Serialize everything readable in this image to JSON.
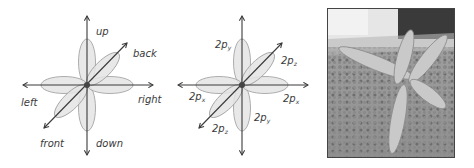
{
  "figures": [
    {
      "id": "direction-diagram",
      "labels": {
        "up": "up",
        "back": "back",
        "left": "left",
        "right": "right",
        "front": "front",
        "down": "down"
      }
    },
    {
      "id": "orbital-diagram",
      "labels": {
        "y_top": {
          "base": "2p",
          "sub": "y"
        },
        "z_upper": {
          "base": "2p",
          "sub": "z"
        },
        "x_left": {
          "base": "2p",
          "sub": "x"
        },
        "x_right": {
          "base": "2p",
          "sub": "x"
        },
        "z_lower": {
          "base": "2p",
          "sub": "z"
        },
        "y_bottom": {
          "base": "2p",
          "sub": "y"
        }
      }
    },
    {
      "id": "balloon-model-photo",
      "description": "photo of balloon model with six lobes on carpet"
    }
  ],
  "colors": {
    "lobe_fill": "#e4e4e4",
    "lobe_stroke": "#9a9a9a",
    "axis": "#3a3a3a",
    "nucleus": "#444444"
  }
}
